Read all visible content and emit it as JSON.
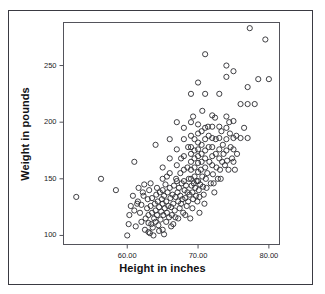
{
  "chart_data": {
    "type": "scatter",
    "title": "",
    "xlabel": "Height in inches",
    "ylabel": "Weight in pounds",
    "xlim": [
      51.0,
      81.5
    ],
    "ylim": [
      92,
      288
    ],
    "xticks": [
      "60.00",
      "70.00",
      "80.00"
    ],
    "xtick_values": [
      60,
      70,
      80
    ],
    "yticks": [
      "100",
      "150",
      "200",
      "250"
    ],
    "ytick_values": [
      100,
      150,
      200,
      250
    ],
    "grid": false,
    "legend": null,
    "marker": "open-circle",
    "marker_color": "#2b2b30",
    "marker_radius": 2.6,
    "n_points": 232,
    "points": [
      [
        52.8,
        134
      ],
      [
        56.3,
        150
      ],
      [
        58.4,
        140
      ],
      [
        60.0,
        100
      ],
      [
        60.2,
        110
      ],
      [
        60.3,
        118
      ],
      [
        60.5,
        126
      ],
      [
        60.8,
        135
      ],
      [
        61.0,
        165
      ],
      [
        61.0,
        122
      ],
      [
        61.2,
        108
      ],
      [
        61.5,
        130
      ],
      [
        61.6,
        142
      ],
      [
        61.8,
        120
      ],
      [
        62.0,
        112
      ],
      [
        62.0,
        127
      ],
      [
        62.2,
        138
      ],
      [
        62.4,
        145
      ],
      [
        62.5,
        105
      ],
      [
        62.6,
        115
      ],
      [
        62.8,
        124
      ],
      [
        62.9,
        132
      ],
      [
        63.0,
        103
      ],
      [
        63.0,
        111
      ],
      [
        63.0,
        118
      ],
      [
        63.1,
        140
      ],
      [
        63.2,
        102
      ],
      [
        63.3,
        126
      ],
      [
        63.4,
        110
      ],
      [
        63.5,
        120
      ],
      [
        63.5,
        133
      ],
      [
        63.6,
        107
      ],
      [
        63.8,
        115
      ],
      [
        63.9,
        128
      ],
      [
        64.0,
        180
      ],
      [
        64.0,
        112
      ],
      [
        64.0,
        122
      ],
      [
        64.1,
        136
      ],
      [
        64.2,
        118
      ],
      [
        64.3,
        130
      ],
      [
        64.4,
        109
      ],
      [
        64.5,
        125
      ],
      [
        64.6,
        138
      ],
      [
        64.7,
        114
      ],
      [
        64.8,
        121
      ],
      [
        64.9,
        132
      ],
      [
        65.0,
        160
      ],
      [
        65.0,
        150
      ],
      [
        65.0,
        140
      ],
      [
        65.0,
        128
      ],
      [
        65.1,
        118
      ],
      [
        65.2,
        135
      ],
      [
        65.3,
        124
      ],
      [
        65.4,
        145
      ],
      [
        65.5,
        112
      ],
      [
        65.5,
        130
      ],
      [
        65.6,
        120
      ],
      [
        65.7,
        138
      ],
      [
        65.8,
        126
      ],
      [
        65.9,
        116
      ],
      [
        66.0,
        185
      ],
      [
        66.0,
        168
      ],
      [
        66.0,
        155
      ],
      [
        66.0,
        142
      ],
      [
        66.1,
        133
      ],
      [
        66.2,
        125
      ],
      [
        66.3,
        118
      ],
      [
        66.4,
        136
      ],
      [
        66.5,
        128
      ],
      [
        66.5,
        110
      ],
      [
        66.6,
        144
      ],
      [
        66.7,
        122
      ],
      [
        66.8,
        134
      ],
      [
        66.9,
        150
      ],
      [
        67.0,
        200
      ],
      [
        67.0,
        176
      ],
      [
        67.0,
        162
      ],
      [
        67.0,
        148
      ],
      [
        67.1,
        138
      ],
      [
        67.2,
        130
      ],
      [
        67.3,
        142
      ],
      [
        67.4,
        124
      ],
      [
        67.5,
        155
      ],
      [
        67.5,
        135
      ],
      [
        67.6,
        128
      ],
      [
        67.7,
        146
      ],
      [
        67.8,
        132
      ],
      [
        67.9,
        120
      ],
      [
        68.0,
        195
      ],
      [
        68.0,
        185
      ],
      [
        68.0,
        170
      ],
      [
        68.0,
        158
      ],
      [
        68.0,
        148
      ],
      [
        68.1,
        140
      ],
      [
        68.2,
        133
      ],
      [
        68.3,
        144
      ],
      [
        68.4,
        126
      ],
      [
        68.5,
        160
      ],
      [
        68.5,
        138
      ],
      [
        68.6,
        130
      ],
      [
        68.7,
        150
      ],
      [
        68.8,
        136
      ],
      [
        68.9,
        115
      ],
      [
        69.0,
        225
      ],
      [
        69.0,
        200
      ],
      [
        69.0,
        188
      ],
      [
        69.0,
        178
      ],
      [
        69.0,
        172
      ],
      [
        69.0,
        165
      ],
      [
        69.0,
        158
      ],
      [
        69.0,
        150
      ],
      [
        69.1,
        144
      ],
      [
        69.2,
        138
      ],
      [
        69.3,
        132
      ],
      [
        69.4,
        146
      ],
      [
        69.5,
        185
      ],
      [
        69.5,
        175
      ],
      [
        69.5,
        168
      ],
      [
        69.5,
        160
      ],
      [
        69.5,
        152
      ],
      [
        69.6,
        142
      ],
      [
        69.7,
        135
      ],
      [
        69.8,
        148
      ],
      [
        69.9,
        130
      ],
      [
        70.0,
        235
      ],
      [
        70.0,
        198
      ],
      [
        70.0,
        190
      ],
      [
        70.0,
        182
      ],
      [
        70.0,
        176
      ],
      [
        70.0,
        170
      ],
      [
        70.0,
        164
      ],
      [
        70.0,
        156
      ],
      [
        70.0,
        148
      ],
      [
        70.1,
        140
      ],
      [
        70.2,
        134
      ],
      [
        70.3,
        145
      ],
      [
        70.4,
        158
      ],
      [
        70.5,
        192
      ],
      [
        70.5,
        180
      ],
      [
        70.5,
        172
      ],
      [
        70.5,
        165
      ],
      [
        70.6,
        152
      ],
      [
        70.7,
        143
      ],
      [
        70.8,
        136
      ],
      [
        70.9,
        128
      ],
      [
        71.0,
        260
      ],
      [
        71.0,
        225
      ],
      [
        71.0,
        195
      ],
      [
        71.0,
        185
      ],
      [
        71.0,
        175
      ],
      [
        71.0,
        168
      ],
      [
        71.0,
        160
      ],
      [
        71.1,
        150
      ],
      [
        71.2,
        142
      ],
      [
        71.3,
        155
      ],
      [
        71.5,
        188
      ],
      [
        71.5,
        178
      ],
      [
        71.6,
        165
      ],
      [
        71.8,
        146
      ],
      [
        72.0,
        206
      ],
      [
        72.0,
        196
      ],
      [
        72.0,
        186
      ],
      [
        72.0,
        178
      ],
      [
        72.0,
        170
      ],
      [
        72.0,
        162
      ],
      [
        72.1,
        154
      ],
      [
        72.2,
        146
      ],
      [
        72.3,
        138
      ],
      [
        72.5,
        185
      ],
      [
        72.5,
        172
      ],
      [
        72.6,
        160
      ],
      [
        72.8,
        150
      ],
      [
        73.0,
        225
      ],
      [
        73.0,
        196
      ],
      [
        73.0,
        186
      ],
      [
        73.0,
        176
      ],
      [
        73.0,
        168
      ],
      [
        73.1,
        158
      ],
      [
        73.2,
        150
      ],
      [
        73.4,
        165
      ],
      [
        73.5,
        180
      ],
      [
        73.6,
        172
      ],
      [
        73.8,
        162
      ],
      [
        74.0,
        250
      ],
      [
        74.0,
        240
      ],
      [
        74.0,
        205
      ],
      [
        74.0,
        195
      ],
      [
        74.0,
        185
      ],
      [
        74.0,
        175
      ],
      [
        74.1,
        166
      ],
      [
        74.3,
        158
      ],
      [
        74.5,
        190
      ],
      [
        74.6,
        178
      ],
      [
        74.8,
        168
      ],
      [
        75.0,
        245
      ],
      [
        75.0,
        201
      ],
      [
        75.0,
        186
      ],
      [
        75.0,
        176
      ],
      [
        75.0,
        165
      ],
      [
        75.2,
        158
      ],
      [
        75.5,
        172
      ],
      [
        76.0,
        216
      ],
      [
        76.0,
        186
      ],
      [
        76.5,
        195
      ],
      [
        77.0,
        231
      ],
      [
        77.0,
        216
      ],
      [
        77.0,
        186
      ],
      [
        77.3,
        283
      ],
      [
        78.0,
        216
      ],
      [
        78.5,
        238
      ],
      [
        79.5,
        273
      ],
      [
        80.0,
        238
      ],
      [
        65.0,
        105
      ],
      [
        65.2,
        101
      ],
      [
        64.5,
        104
      ],
      [
        63.7,
        100
      ],
      [
        66.2,
        108
      ],
      [
        62.3,
        135
      ],
      [
        61.4,
        128
      ],
      [
        67.2,
        115
      ],
      [
        68.2,
        118
      ],
      [
        69.2,
        124
      ],
      [
        70.2,
        120
      ],
      [
        66.8,
        116
      ],
      [
        64.2,
        142
      ],
      [
        63.3,
        146
      ],
      [
        65.6,
        152
      ],
      [
        67.6,
        168
      ],
      [
        68.6,
        178
      ],
      [
        71.4,
        196
      ],
      [
        72.4,
        204
      ],
      [
        73.3,
        192
      ],
      [
        74.4,
        200
      ],
      [
        75.4,
        188
      ],
      [
        70.6,
        210
      ],
      [
        69.3,
        205
      ]
    ]
  },
  "axes": {
    "x_title": "Height in inches",
    "y_title": "Weight in pounds",
    "x_tick_labels": [
      "60.00",
      "70.00",
      "80.00"
    ],
    "y_tick_labels": [
      "250",
      "200",
      "150",
      "100"
    ]
  },
  "colors": {
    "frame": "#3a3a42",
    "plot_border": "#53535b",
    "marker": "#2b2b30",
    "text": "#111114",
    "background": "#ffffff"
  }
}
